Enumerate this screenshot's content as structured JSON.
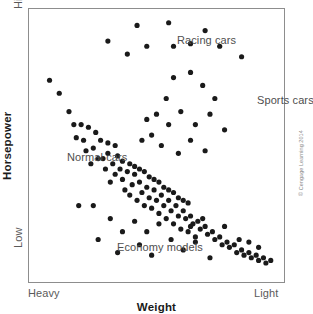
{
  "figure": {
    "background_color": "#ffffff",
    "frame_color": "#8d8d8d",
    "point_color": "#1a1a1a"
  },
  "axes": {
    "y_title": "Horsepower",
    "y_high_label": "High",
    "y_low_label": "Low",
    "x_title": "Weight",
    "x_heavy_label": "Heavy",
    "x_light_label": "Light"
  },
  "annotations": {
    "racing": "Racing cars",
    "sports": "Sports cars",
    "normal": "Normal cars",
    "economy": "Economy models"
  },
  "credit": "© Cengage Learning 2014",
  "chart_data": {
    "type": "scatter",
    "title": "",
    "xlabel": "Weight",
    "ylabel": "Horsepower",
    "xlim": [
      0,
      100
    ],
    "ylim": [
      0,
      100
    ],
    "x_axis_direction": "Heavy (left) to Light (right)",
    "y_axis_direction": "Low (bottom) to High (top)",
    "x_tick_labels": [
      "Heavy",
      "Light"
    ],
    "y_tick_labels": [
      "Low",
      "High"
    ],
    "grid": false,
    "legend": "none",
    "annotation_groups": [
      {
        "name": "Racing cars",
        "x": 47,
        "y": 92
      },
      {
        "name": "Sports cars",
        "x": 79,
        "y": 70
      },
      {
        "name": "Normal cars",
        "x": 5,
        "y": 50
      },
      {
        "name": "Economy models",
        "x": 24,
        "y": 18
      }
    ],
    "point_radius_px": 2.6,
    "n_points": 134,
    "series": [
      {
        "name": "Normal cars",
        "comment": "Dense downward-sloping band running from upper-left to lower-right",
        "points": [
          [
            6,
            75
          ],
          [
            10,
            70
          ],
          [
            14,
            63
          ],
          [
            16,
            58
          ],
          [
            19,
            58
          ],
          [
            17,
            53
          ],
          [
            20,
            52
          ],
          [
            21,
            48
          ],
          [
            24,
            49
          ],
          [
            26,
            45
          ],
          [
            23,
            43
          ],
          [
            28,
            45
          ],
          [
            30,
            47
          ],
          [
            29,
            41
          ],
          [
            32,
            43
          ],
          [
            33,
            39
          ],
          [
            31,
            36
          ],
          [
            35,
            41
          ],
          [
            36,
            37
          ],
          [
            38,
            40
          ],
          [
            37,
            33
          ],
          [
            40,
            35
          ],
          [
            41,
            39
          ],
          [
            39,
            31
          ],
          [
            43,
            36
          ],
          [
            44,
            32
          ],
          [
            42,
            29
          ],
          [
            46,
            34
          ],
          [
            47,
            30
          ],
          [
            45,
            27
          ],
          [
            49,
            33
          ],
          [
            50,
            29
          ],
          [
            48,
            26
          ],
          [
            52,
            31
          ],
          [
            53,
            27
          ],
          [
            51,
            24
          ],
          [
            55,
            29
          ],
          [
            56,
            25
          ],
          [
            54,
            22
          ],
          [
            58,
            27
          ],
          [
            59,
            23
          ],
          [
            57,
            20
          ],
          [
            61,
            25
          ],
          [
            62,
            22
          ],
          [
            60,
            18
          ],
          [
            64,
            23
          ],
          [
            65,
            20
          ],
          [
            63,
            17
          ],
          [
            67,
            21
          ],
          [
            68,
            18
          ],
          [
            66,
            15
          ],
          [
            70,
            19
          ],
          [
            71,
            16
          ],
          [
            73,
            17
          ],
          [
            74,
            14
          ],
          [
            76,
            15
          ],
          [
            77,
            12
          ],
          [
            79,
            13
          ],
          [
            80,
            11
          ],
          [
            82,
            12
          ],
          [
            83,
            9
          ],
          [
            85,
            10
          ],
          [
            86,
            8
          ],
          [
            88,
            9
          ],
          [
            89,
            7
          ],
          [
            91,
            8
          ],
          [
            92,
            6
          ],
          [
            94,
            7
          ],
          [
            95,
            5
          ],
          [
            97,
            6
          ],
          [
            34,
            46
          ],
          [
            36,
            44
          ],
          [
            39,
            43
          ],
          [
            41,
            42
          ],
          [
            43,
            41
          ],
          [
            45,
            40
          ],
          [
            47,
            38
          ],
          [
            49,
            37
          ],
          [
            51,
            36
          ],
          [
            53,
            34
          ],
          [
            55,
            33
          ],
          [
            57,
            32
          ],
          [
            59,
            30
          ],
          [
            61,
            29
          ],
          [
            63,
            28
          ],
          [
            30,
            51
          ],
          [
            33,
            50
          ],
          [
            27,
            52
          ],
          [
            25,
            55
          ],
          [
            22,
            57
          ]
        ]
      },
      {
        "name": "Racing cars",
        "comment": "Isolated high-horsepower points across the upper part of the plot",
        "points": [
          [
            42,
            96
          ],
          [
            46,
            88
          ],
          [
            55,
            97
          ],
          [
            57,
            88
          ],
          [
            64,
            89
          ],
          [
            70,
            94
          ],
          [
            76,
            88
          ],
          [
            38,
            85
          ],
          [
            85,
            84
          ],
          [
            30,
            90
          ]
        ]
      },
      {
        "name": "Sports cars",
        "comment": "Mid-high cluster to the right of centre",
        "points": [
          [
            57,
            76
          ],
          [
            64,
            78
          ],
          [
            69,
            73
          ],
          [
            54,
            68
          ],
          [
            74,
            68
          ],
          [
            50,
            62
          ],
          [
            60,
            63
          ],
          [
            55,
            58
          ],
          [
            46,
            60
          ],
          [
            66,
            58
          ],
          [
            64,
            52
          ],
          [
            78,
            56
          ],
          [
            52,
            50
          ],
          [
            70,
            48
          ],
          [
            59,
            47
          ],
          [
            48,
            54
          ],
          [
            72,
            62
          ],
          [
            44,
            52
          ]
        ]
      },
      {
        "name": "Economy models",
        "comment": "Low-horsepower scatter below the main band",
        "points": [
          [
            18,
            27
          ],
          [
            24,
            27
          ],
          [
            31,
            22
          ],
          [
            41,
            21
          ],
          [
            36,
            17
          ],
          [
            46,
            17
          ],
          [
            51,
            20
          ],
          [
            43,
            12
          ],
          [
            56,
            14
          ],
          [
            61,
            10
          ],
          [
            66,
            13
          ],
          [
            26,
            14
          ],
          [
            34,
            9
          ],
          [
            48,
            8
          ],
          [
            78,
            19
          ],
          [
            72,
            7
          ],
          [
            84,
            14
          ],
          [
            88,
            13
          ],
          [
            92,
            11
          ],
          [
            69,
            22
          ],
          [
            64,
            19
          ]
        ]
      }
    ]
  }
}
